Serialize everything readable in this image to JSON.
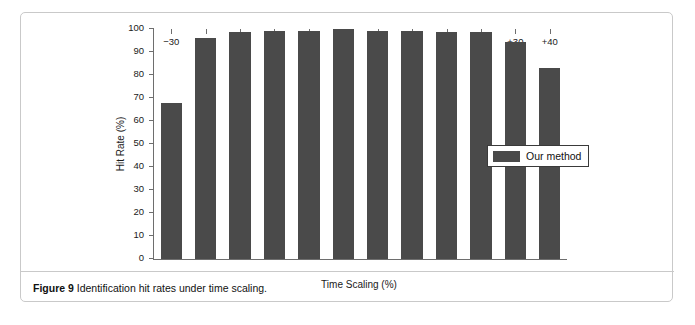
{
  "figure": {
    "caption_number": "Figure 9",
    "caption_text": "Identification hit rates under time scaling."
  },
  "legend": {
    "position": "inside-right",
    "entries": [
      {
        "label": "Our method",
        "color": "#4a4a4a"
      }
    ]
  },
  "colors": {
    "bar": "#4a4a4a",
    "axis": "#6e6e6e",
    "card_border": "#c9c9c9",
    "background": "#ffffff",
    "text": "#111111"
  },
  "chart_data": {
    "type": "bar",
    "title": "",
    "xlabel": "Time Scaling (%)",
    "ylabel": "Hit Rate (%)",
    "categories": [
      "−30",
      "−20",
      "−10",
      "−5",
      "−2",
      "0",
      "+2",
      "+5",
      "+10",
      "+20",
      "+30",
      "+40"
    ],
    "values": [
      67.7,
      96.0,
      98.7,
      99.3,
      99.3,
      99.8,
      99.3,
      99.3,
      98.8,
      98.5,
      94.5,
      83.0
    ],
    "series": [
      {
        "name": "Our method",
        "values": [
          67.7,
          96.0,
          98.7,
          99.3,
          99.3,
          99.8,
          99.3,
          99.3,
          98.8,
          98.5,
          94.5,
          83.0
        ]
      }
    ],
    "ylim": [
      0,
      100
    ],
    "yticks": [
      0,
      10,
      20,
      30,
      40,
      50,
      60,
      70,
      80,
      90,
      100
    ],
    "ytick_labels": [
      "0",
      "10",
      "20",
      "30",
      "40",
      "50",
      "60",
      "70",
      "80",
      "90",
      "100"
    ],
    "grid": false,
    "legend_position": "inside-right"
  }
}
